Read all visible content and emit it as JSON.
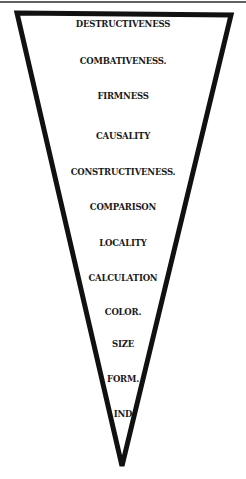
{
  "diagram": {
    "shape": "inverted-triangle",
    "stroke_color": "#111111",
    "labels": [
      {
        "text": "DESTRUCTIVENESS",
        "y": 19,
        "x": 123
      },
      {
        "text": "COMBATIVENESS.",
        "y": 57,
        "x": 121
      },
      {
        "text": "FIRMNESS",
        "y": 92,
        "x": 120
      },
      {
        "text": "CAUSALITY",
        "y": 132,
        "x": 120
      },
      {
        "text": "CONSTRUCTIVENESS.",
        "y": 168,
        "x": 121
      },
      {
        "text": "COMPARISON",
        "y": 203,
        "x": 120
      },
      {
        "text": "LOCALITY",
        "y": 239,
        "x": 120
      },
      {
        "text": "CALCULATION",
        "y": 274,
        "x": 121
      },
      {
        "text": "COLOR.",
        "y": 308,
        "x": 121
      },
      {
        "text": "SIZE",
        "y": 340,
        "x": 120
      },
      {
        "text": "FORM.",
        "y": 375,
        "x": 121
      },
      {
        "text": "IND",
        "y": 410,
        "x": 120
      }
    ]
  }
}
